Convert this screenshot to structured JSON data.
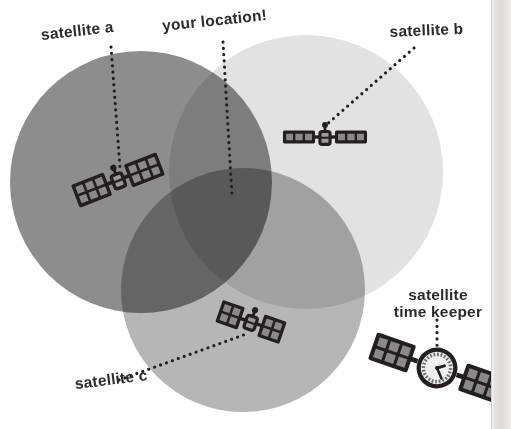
{
  "illustration": {
    "title": "GPS trilateration diagram",
    "background_color": "#ffffff",
    "ink_color": "#231f20"
  },
  "labels": {
    "satellite_a": "satellite a",
    "your_location": "your location!",
    "satellite_b": "satellite b",
    "satellite_c": "satellite c",
    "time_keeper_line1": "satellite",
    "time_keeper_line2": "time keeper"
  },
  "coverage_circles": [
    {
      "id": "circle-a",
      "label": "satellite a coverage",
      "cx": 141,
      "cy": 182,
      "r": 131,
      "color": "#8d8d8d"
    },
    {
      "id": "circle-b",
      "label": "satellite b coverage",
      "cx": 306,
      "cy": 172,
      "r": 137,
      "color": "#e2e2e2"
    },
    {
      "id": "circle-c",
      "label": "satellite c coverage",
      "cx": 243,
      "cy": 290,
      "r": 122,
      "color": "#b6b6b6"
    }
  ],
  "satellites": [
    {
      "id": "satellite-a",
      "name": "satellite a",
      "x": 118,
      "y": 180,
      "rotation": -21,
      "scale": 1.0,
      "panel_rows": 2,
      "panel_cols": 3,
      "style": "antenna"
    },
    {
      "id": "satellite-b",
      "name": "satellite b",
      "x": 325,
      "y": 137,
      "rotation": 0,
      "scale": 0.92,
      "panel_rows": 1,
      "panel_cols": 3,
      "style": "antenna"
    },
    {
      "id": "satellite-c",
      "name": "satellite c",
      "x": 251,
      "y": 322,
      "rotation": 19,
      "scale": 0.96,
      "panel_rows": 2,
      "panel_cols": 2,
      "style": "antenna"
    },
    {
      "id": "satellite-time-keeper",
      "name": "satellite time keeper",
      "x": 437,
      "y": 368,
      "rotation": 19,
      "scale": 1.18,
      "panel_rows": 2,
      "panel_cols": 3,
      "style": "clock"
    }
  ],
  "clock": {
    "hour_hand_angle_deg": 55,
    "minute_hand_angle_deg": 138,
    "face_color": "#efefef",
    "tick_count": 24
  },
  "leader_lines": [
    {
      "id": "leader-satellite-a",
      "from": [
        111,
        47
      ],
      "to": [
        120,
        168
      ]
    },
    {
      "id": "leader-your-location",
      "from": [
        223,
        42
      ],
      "to": [
        232,
        196
      ]
    },
    {
      "id": "leader-satellite-b",
      "from": [
        414,
        48
      ],
      "to": [
        325,
        126
      ]
    },
    {
      "id": "leader-satellite-c",
      "from": [
        119,
        380
      ],
      "to": [
        249,
        333
      ]
    },
    {
      "id": "leader-time-keeper",
      "from": [
        437,
        320
      ],
      "to": [
        437,
        352
      ]
    }
  ],
  "page_edge": {
    "present": true,
    "x": 491,
    "description": "book page edge shading"
  }
}
